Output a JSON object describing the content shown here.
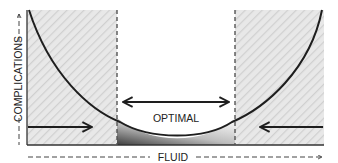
{
  "diagram": {
    "x_axis_label": "FLUID",
    "y_axis_label": "COMPLICATIONS",
    "optimal_label": "OPTIMAL",
    "colors": {
      "hatch_bg": "#e6e6e6",
      "hatch_line": "#d2d2d2",
      "curve": "#1e1e1e",
      "dashed": "#555555",
      "optimal_gradient_dark": "#4a4a4a",
      "optimal_gradient_light": "#ffffff"
    }
  }
}
